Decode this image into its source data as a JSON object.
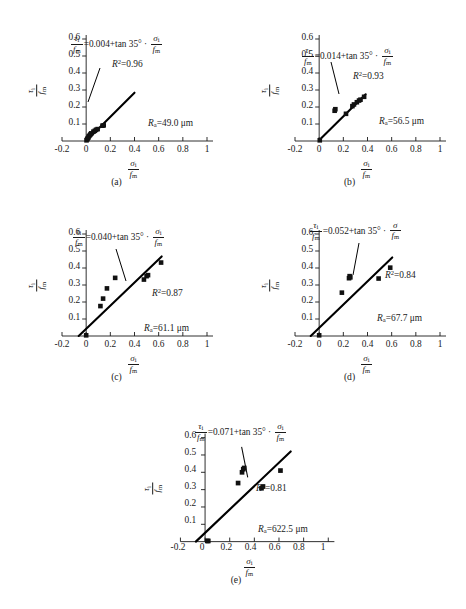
{
  "figure": {
    "axis": {
      "x_label_num": "σ",
      "x_label_sub": "i",
      "x_label_den": "f",
      "x_label_den_sub": "m",
      "y_label_num": "τ",
      "y_label_sub": "i",
      "y_label_den": "f",
      "y_label_den_sub": "m",
      "x_ticks": [
        "-0.2",
        "0",
        "0.2",
        "0.4",
        "0.6",
        "0.8",
        "1"
      ],
      "x_tick_values": [
        -0.2,
        0,
        0.2,
        0.4,
        0.6,
        0.8,
        1.0
      ],
      "y_ticks": [
        "0.1",
        "0.2",
        "0.3",
        "0.4",
        "0.5",
        "0.6"
      ],
      "y_tick_values": [
        0.1,
        0.2,
        0.3,
        0.4,
        0.5,
        0.6
      ],
      "xlim": [
        -0.2,
        1.0
      ],
      "ylim": [
        0.0,
        0.6
      ],
      "angle_text": "tan 35°",
      "marker_color": "#111111",
      "line_color": "#000000",
      "axis_color": "#1a1a1a"
    },
    "panels": [
      {
        "id": "a",
        "caption": "(a)",
        "intercept": "0.004",
        "r2_label": "R",
        "r2_value": "=0.96",
        "ra_label": "R",
        "ra_sub": "a",
        "ra_value": "=49.0 μm",
        "sigma_has_sub": true,
        "line": [
          [
            0.0,
            0.0
          ],
          [
            0.4,
            0.284
          ]
        ],
        "points": [
          [
            0.003,
            0.004
          ],
          [
            0.008,
            0.01
          ],
          [
            0.012,
            0.015
          ],
          [
            0.018,
            0.02
          ],
          [
            0.022,
            0.028
          ],
          [
            0.03,
            0.034
          ],
          [
            0.036,
            0.04
          ],
          [
            0.042,
            0.045
          ],
          [
            0.06,
            0.055
          ],
          [
            0.072,
            0.06
          ],
          [
            0.082,
            0.066
          ],
          [
            0.095,
            0.07
          ],
          [
            0.135,
            0.09
          ],
          [
            0.145,
            0.092
          ]
        ]
      },
      {
        "id": "b",
        "caption": "(b)",
        "intercept": "0.014",
        "r2_label": "R",
        "r2_value": "=0.93",
        "ra_label": "R",
        "ra_sub": "a",
        "ra_value": "=56.5 μm",
        "sigma_has_sub": true,
        "line": [
          [
            0.0,
            0.005
          ],
          [
            0.385,
            0.275
          ]
        ],
        "points": [
          [
            0.005,
            0.004
          ],
          [
            0.128,
            0.178
          ],
          [
            0.134,
            0.187
          ],
          [
            0.222,
            0.16
          ],
          [
            0.275,
            0.205
          ],
          [
            0.288,
            0.215
          ],
          [
            0.312,
            0.228
          ],
          [
            0.33,
            0.238
          ],
          [
            0.342,
            0.243
          ],
          [
            0.372,
            0.26
          ]
        ]
      },
      {
        "id": "c",
        "caption": "(c)",
        "intercept": "0.040",
        "r2_label": "R",
        "r2_value": "=0.87",
        "ra_label": "R",
        "ra_sub": "a",
        "ra_value": "=61.1 μm",
        "sigma_has_sub": true,
        "line": [
          [
            -0.062,
            0.0
          ],
          [
            0.625,
            0.468
          ]
        ],
        "points": [
          [
            0.0,
            0.004
          ],
          [
            0.118,
            0.176
          ],
          [
            0.14,
            0.22
          ],
          [
            0.172,
            0.28
          ],
          [
            0.24,
            0.342
          ],
          [
            0.478,
            0.332
          ],
          [
            0.5,
            0.352
          ],
          [
            0.512,
            0.358
          ],
          [
            0.62,
            0.432
          ]
        ]
      },
      {
        "id": "d",
        "caption": "(d)",
        "intercept": "0.052",
        "r2_label": "R",
        "r2_value": "=0.84",
        "ra_label": "R",
        "ra_sub": "a",
        "ra_value": "=67.7 μm",
        "sigma_has_sub": false,
        "line": [
          [
            -0.07,
            0.0
          ],
          [
            0.605,
            0.462
          ]
        ],
        "points": [
          [
            0.0,
            0.004
          ],
          [
            0.188,
            0.255
          ],
          [
            0.247,
            0.34
          ],
          [
            0.252,
            0.352
          ],
          [
            0.258,
            0.345
          ],
          [
            0.492,
            0.338
          ],
          [
            0.588,
            0.402
          ]
        ]
      },
      {
        "id": "e",
        "caption": "(e)",
        "intercept": "0.071",
        "r2_label": "R",
        "r2_value": "=0.81",
        "ra_label": "R",
        "ra_sub": "a",
        "ra_value": "=622.5 μm",
        "sigma_has_sub": true,
        "line": [
          [
            -0.075,
            0.0
          ],
          [
            0.695,
            0.52
          ]
        ],
        "points": [
          [
            0.018,
            0.004
          ],
          [
            0.026,
            0.004
          ],
          [
            0.268,
            0.338
          ],
          [
            0.3,
            0.4
          ],
          [
            0.31,
            0.418
          ],
          [
            0.318,
            0.425
          ],
          [
            0.458,
            0.308
          ],
          [
            0.47,
            0.318
          ],
          [
            0.612,
            0.41
          ]
        ]
      }
    ]
  },
  "chart_data": {
    "type": "scatter",
    "title": "",
    "xlabel": "σi/fm",
    "ylabel": "τi/fm",
    "xlim": [
      -0.2,
      1.0
    ],
    "ylim": [
      0.0,
      0.6
    ],
    "grid": false,
    "legend": "none",
    "panels": [
      {
        "panel": "(a)",
        "annotation": "τi/fm =0.004+tan 35° · σi/fm",
        "intercept": 0.004,
        "slope": 0.7002,
        "r_squared": 0.96,
        "Ra_um": 49.0,
        "x": [
          0.003,
          0.008,
          0.012,
          0.018,
          0.022,
          0.03,
          0.036,
          0.042,
          0.06,
          0.072,
          0.082,
          0.095,
          0.135,
          0.145
        ],
        "y": [
          0.004,
          0.01,
          0.015,
          0.02,
          0.028,
          0.034,
          0.04,
          0.045,
          0.055,
          0.06,
          0.066,
          0.07,
          0.09,
          0.092
        ]
      },
      {
        "panel": "(b)",
        "annotation": "τi/fm =0.014+tan 35° · σi/fm",
        "intercept": 0.014,
        "slope": 0.7002,
        "r_squared": 0.93,
        "Ra_um": 56.5,
        "x": [
          0.005,
          0.128,
          0.134,
          0.222,
          0.275,
          0.288,
          0.312,
          0.33,
          0.342,
          0.372
        ],
        "y": [
          0.004,
          0.178,
          0.187,
          0.16,
          0.205,
          0.215,
          0.228,
          0.238,
          0.243,
          0.26
        ]
      },
      {
        "panel": "(c)",
        "annotation": "τi/fm =0.040+tan 35° · σi/fm",
        "intercept": 0.04,
        "slope": 0.7002,
        "r_squared": 0.87,
        "Ra_um": 61.1,
        "x": [
          0.0,
          0.118,
          0.14,
          0.172,
          0.24,
          0.478,
          0.5,
          0.512,
          0.62
        ],
        "y": [
          0.004,
          0.176,
          0.22,
          0.28,
          0.342,
          0.332,
          0.352,
          0.358,
          0.432
        ]
      },
      {
        "panel": "(d)",
        "annotation": "τi/fm =0.052+tan 35° · σ/fm",
        "intercept": 0.052,
        "slope": 0.7002,
        "r_squared": 0.84,
        "Ra_um": 67.7,
        "x": [
          0.0,
          0.188,
          0.247,
          0.252,
          0.258,
          0.492,
          0.588
        ],
        "y": [
          0.004,
          0.255,
          0.34,
          0.352,
          0.345,
          0.338,
          0.402
        ]
      },
      {
        "panel": "(e)",
        "annotation": "τi/fm =0.071+tan 35° · σi/fm",
        "intercept": 0.071,
        "slope": 0.7002,
        "r_squared": 0.81,
        "Ra_um": 622.5,
        "x": [
          0.018,
          0.026,
          0.268,
          0.3,
          0.31,
          0.318,
          0.458,
          0.47,
          0.612
        ],
        "y": [
          0.004,
          0.004,
          0.338,
          0.4,
          0.418,
          0.425,
          0.308,
          0.318,
          0.41
        ]
      }
    ]
  }
}
